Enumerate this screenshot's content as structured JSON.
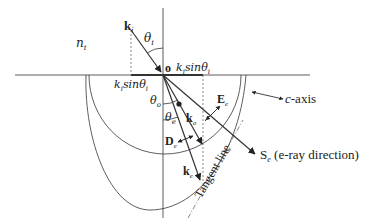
{
  "figure": {
    "type": "birefringence-refraction-diagram",
    "medium_label": "n",
    "medium_label_sub": "i",
    "origin_label": "o",
    "labels": {
      "k_i": {
        "main": "k",
        "sub": "i"
      },
      "theta_i": {
        "main": "θ",
        "sub": "i"
      },
      "k_i_sin_top": "k",
      "k_i_sin_top_rest": "sinθ",
      "k_i_sin_top_sub": "i",
      "k_i_sin_left": "k",
      "k_i_sin_left_rest": "sinθ",
      "k_i_sin_left_sub": "i",
      "theta_o": {
        "main": "θ",
        "sub": "o"
      },
      "theta_e": {
        "main": "θ",
        "sub": "e"
      },
      "E_e": {
        "main": "E",
        "sub": "e"
      },
      "k_o": {
        "main": "k",
        "sub": "o"
      },
      "D_e": {
        "main": "D",
        "sub": "e"
      },
      "k_e": {
        "main": "k",
        "sub": "e"
      },
      "c_axis": {
        "italic": "c",
        "rest": "-axis"
      },
      "S_e": {
        "main": "S",
        "sub": "e",
        "rest": " (e-ray direction)"
      },
      "tangent_line": "Tangent line"
    }
  }
}
